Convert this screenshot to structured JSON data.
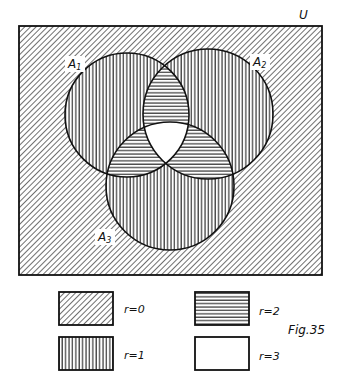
{
  "figure": {
    "caption": "Fig.35",
    "universe_label": "U",
    "sets": [
      {
        "id": "A1",
        "letter": "A",
        "subscript": "1",
        "cx": 127,
        "cy": 115,
        "r": 62,
        "label_x": 68,
        "label_y": 68
      },
      {
        "id": "A2",
        "letter": "A",
        "subscript": "2",
        "cx": 208,
        "cy": 114,
        "r": 65,
        "label_x": 253,
        "label_y": 66
      },
      {
        "id": "A3",
        "letter": "A",
        "subscript": "3",
        "cx": 170,
        "cy": 186,
        "r": 64,
        "label_x": 98,
        "label_y": 241
      }
    ],
    "universe_rect": {
      "x": 19,
      "y": 26,
      "width": 303,
      "height": 249
    },
    "legend": [
      {
        "key": "r0",
        "label": "r=0",
        "pattern": "diagonal",
        "x": 59,
        "y": 292,
        "w": 54,
        "h": 33,
        "label_x": 124,
        "label_y": 313
      },
      {
        "key": "r1",
        "label": "r=1",
        "pattern": "vertical",
        "x": 59,
        "y": 337,
        "w": 54,
        "h": 33,
        "label_x": 124,
        "label_y": 359
      },
      {
        "key": "r2",
        "label": "r=2",
        "pattern": "horizontal",
        "x": 195,
        "y": 292,
        "w": 54,
        "h": 33,
        "label_x": 259,
        "label_y": 315
      },
      {
        "key": "r3",
        "label": "r=3",
        "pattern": "blank",
        "x": 195,
        "y": 337,
        "w": 54,
        "h": 33,
        "label_x": 259,
        "label_y": 360
      }
    ],
    "region_meaning": {
      "r=0": "outside all sets (diagonal hatch)",
      "r=1": "in exactly one set (vertical hatch)",
      "r=2": "in exactly two sets (horizontal hatch)",
      "r=3": "in all three sets (blank)"
    },
    "colors": {
      "ink": "#111111",
      "paper": "#ffffff"
    }
  }
}
